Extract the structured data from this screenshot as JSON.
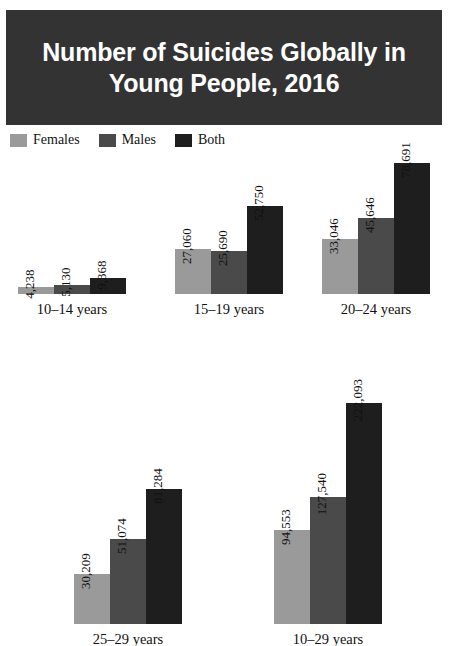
{
  "title": {
    "text": "Number of Suicides Globally in\nYoung People, 2016",
    "banner_color": "#333333",
    "text_color": "#ffffff"
  },
  "legend": {
    "items": [
      {
        "label": "Females",
        "color": "#9a9a9a"
      },
      {
        "label": "Males",
        "color": "#4a4a4a"
      },
      {
        "label": "Both",
        "color": "#1e1e1e"
      }
    ]
  },
  "chart_data": {
    "type": "bar",
    "title": "Number of Suicides Globally in Young People, 2016",
    "xlabel": "",
    "ylabel": "",
    "grid": false,
    "legend_position": "top-left",
    "note": "Five small-multiple panels, one per age group; each panel has three bars (Females, Males, Both). Bars are drawn on a shared linear scale across panels, value labels rotated 90 degrees.",
    "categories": [
      "10–14 years",
      "15–19 years",
      "20–24 years",
      "25–29 years",
      "10–29 years"
    ],
    "series": [
      {
        "name": "Females",
        "color": "#9a9a9a",
        "values": [
          4238,
          27060,
          33046,
          30209,
          94553
        ]
      },
      {
        "name": "Males",
        "color": "#4a4a4a",
        "values": [
          5130,
          25690,
          45646,
          51074,
          127540
        ]
      },
      {
        "name": "Both",
        "color": "#1e1e1e",
        "values": [
          9368,
          52750,
          78691,
          81284,
          222093
        ]
      }
    ],
    "value_labels": [
      [
        "4,238",
        "5,130",
        "9,368"
      ],
      [
        "27,060",
        "25,690",
        "52,750"
      ],
      [
        "33,046",
        "45,646",
        "78,691"
      ],
      [
        "30,209",
        "51,074",
        "81,284"
      ],
      [
        "94,553",
        "127,540",
        "222,093"
      ]
    ]
  },
  "panels": [
    {
      "label": "10–14 years",
      "bars": [
        {
          "series": "Females",
          "value_label": "4,238",
          "color": "#9a9a9a",
          "height_px": 7
        },
        {
          "series": "Males",
          "value_label": "5,130",
          "color": "#4a4a4a",
          "height_px": 9
        },
        {
          "series": "Both",
          "value_label": "9,368",
          "color": "#1e1e1e",
          "height_px": 16
        }
      ]
    },
    {
      "label": "15–19 years",
      "bars": [
        {
          "series": "Females",
          "value_label": "27,060",
          "color": "#9a9a9a",
          "height_px": 45
        },
        {
          "series": "Males",
          "value_label": "25,690",
          "color": "#4a4a4a",
          "height_px": 43
        },
        {
          "series": "Both",
          "value_label": "52,750",
          "color": "#1e1e1e",
          "height_px": 88
        }
      ]
    },
    {
      "label": "20–24 years",
      "bars": [
        {
          "series": "Females",
          "value_label": "33,046",
          "color": "#9a9a9a",
          "height_px": 55
        },
        {
          "series": "Males",
          "value_label": "45,646",
          "color": "#4a4a4a",
          "height_px": 76
        },
        {
          "series": "Both",
          "value_label": "78,691",
          "color": "#1e1e1e",
          "height_px": 131
        }
      ]
    },
    {
      "label": "25–29 years",
      "bars": [
        {
          "series": "Females",
          "value_label": "30,209",
          "color": "#9a9a9a",
          "height_px": 50
        },
        {
          "series": "Males",
          "value_label": "51,074",
          "color": "#4a4a4a",
          "height_px": 85
        },
        {
          "series": "Both",
          "value_label": "81,284",
          "color": "#1e1e1e",
          "height_px": 135
        }
      ]
    },
    {
      "label": "10–29 years",
      "bars": [
        {
          "series": "Females",
          "value_label": "94,553",
          "color": "#9a9a9a",
          "height_px": 94
        },
        {
          "series": "Males",
          "value_label": "127,540",
          "color": "#4a4a4a",
          "height_px": 127
        },
        {
          "series": "Both",
          "value_label": "222,093",
          "color": "#1e1e1e",
          "height_px": 221
        }
      ]
    }
  ]
}
